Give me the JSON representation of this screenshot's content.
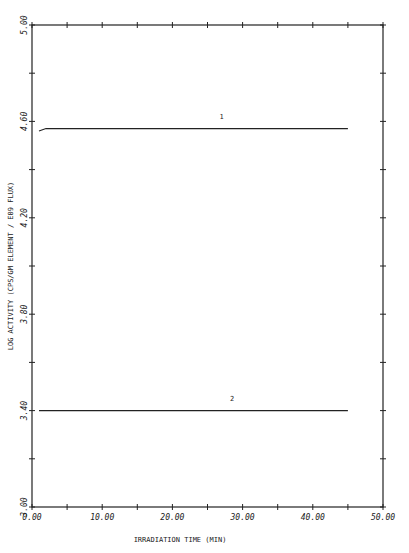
{
  "chart_data": {
    "type": "line",
    "title": "",
    "xlabel": "IRRADIATION TIME (MIN)",
    "ylabel": "LOG ACTIVITY (CPS/GM ELEMENT / E09 FLUX)",
    "xlim": [
      0,
      50
    ],
    "ylim": [
      3.0,
      5.0
    ],
    "x_ticks": [
      "0.00",
      "10.00",
      "20.00",
      "30.00",
      "40.00",
      "50.00"
    ],
    "x_tick_values": [
      0,
      10,
      20,
      30,
      40,
      50
    ],
    "x_minor_step": 5,
    "y_ticks": [
      "3.00",
      "3.40",
      "3.80",
      "4.20",
      "4.60",
      "5.00"
    ],
    "y_tick_values": [
      3.0,
      3.4,
      3.8,
      4.2,
      4.6,
      5.0
    ],
    "y_minor_step": 0.2,
    "grid": false,
    "legend": "inline labels",
    "series": [
      {
        "name": "1",
        "x": [
          1,
          2,
          5,
          10,
          20,
          30,
          40,
          45
        ],
        "y": [
          4.56,
          4.57,
          4.57,
          4.57,
          4.57,
          4.57,
          4.57,
          4.57
        ]
      },
      {
        "name": "2",
        "x": [
          1,
          2,
          5,
          10,
          20,
          30,
          40,
          45
        ],
        "y": [
          3.4,
          3.4,
          3.4,
          3.4,
          3.4,
          3.4,
          3.4,
          3.4
        ]
      }
    ],
    "series_label_positions": [
      {
        "name": "1",
        "x": 27,
        "y": 4.61
      },
      {
        "name": "2",
        "x": 28.5,
        "y": 3.44
      }
    ]
  },
  "colors": {
    "ink": "#222222",
    "background": "#ffffff"
  }
}
